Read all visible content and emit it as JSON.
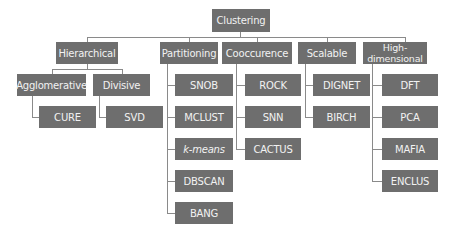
{
  "diagram": {
    "type": "tree",
    "colors": {
      "node_fill": "#6e6e6e",
      "node_text": "#f2f2f2",
      "connector": "#8a8a8a",
      "background": "#ffffff"
    },
    "root": "Clustering",
    "categories": {
      "hierarchical": {
        "label": "Hierarchical",
        "agglomerative": {
          "label": "Agglomerative",
          "children": [
            "CURE"
          ]
        },
        "divisive": {
          "label": "Divisive",
          "children": [
            "SVD"
          ]
        }
      },
      "partitioning": {
        "label": "Partitioning",
        "children": [
          "SNOB",
          "MCLUST",
          "k-means",
          "DBSCAN",
          "BANG"
        ]
      },
      "cooccurence": {
        "label": "Cooccurence",
        "children": [
          "ROCK",
          "SNN",
          "CACTUS"
        ]
      },
      "scalable": {
        "label": "Scalable",
        "children": [
          "DIGNET",
          "BIRCH"
        ]
      },
      "high_dimensional": {
        "label": "High-dimensional",
        "children": [
          "DFT",
          "PCA",
          "MAFIA",
          "ENCLUS"
        ]
      }
    }
  }
}
